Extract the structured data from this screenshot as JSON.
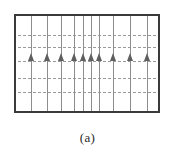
{
  "figure": {
    "caption": "(a)",
    "frame": {
      "x": 14,
      "y": 14,
      "width": 146,
      "height": 99,
      "border_color": "#3a3a3a",
      "border_width": 2,
      "fill_color": "#ffffff"
    },
    "flow_lines": {
      "label": "vertical flow lines",
      "color": "#8d8d8d",
      "count": 10,
      "x_percent": [
        10.5,
        21.5,
        31.5,
        40.5,
        47.5,
        52.5,
        58.5,
        68.5,
        80.0,
        92.0
      ]
    },
    "equipotential_lines": {
      "label": "horizontal dashed equipotential lines",
      "color": "#9a9a9a",
      "style": "dashed",
      "count": 5,
      "y_percent": [
        20.0,
        33.0,
        47.0,
        65.0,
        80.0
      ]
    },
    "flow_arrows": {
      "label": "upward seepage flow arrows",
      "color": "#5f5f5f",
      "direction": "up",
      "count": 10,
      "y_percent": 47.0,
      "x_percent": [
        10.5,
        21.5,
        31.5,
        40.5,
        47.5,
        52.5,
        58.5,
        68.5,
        80.0,
        92.0
      ]
    }
  }
}
